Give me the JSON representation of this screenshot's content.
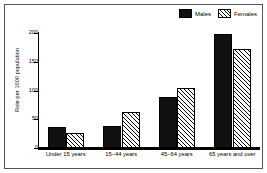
{
  "chart_data": {
    "type": "bar",
    "title": "",
    "xlabel": "",
    "ylabel": "Rate per 1000 population",
    "categories": [
      "Under 15 years",
      "15–44 years",
      "45–64 years",
      "65 years and over"
    ],
    "series": [
      {
        "name": "Males",
        "values": [
          36,
          39,
          88,
          198
        ]
      },
      {
        "name": "Females",
        "values": [
          26,
          63,
          104,
          172
        ]
      }
    ],
    "ylim": [
      0,
      200
    ],
    "yticks": [
      0,
      50,
      100,
      150,
      200
    ],
    "ytick_labels": [
      "0",
      "50",
      "100",
      "150",
      "200"
    ],
    "grid": false,
    "legend_position": "top-right"
  },
  "legend": {
    "males_label": "Males",
    "females_label": "Females"
  },
  "colors": {
    "males_fill": "#111111",
    "females_fill": "#ffffff",
    "hatch": "#000000",
    "axis": "#000000",
    "frame": "#555555",
    "background": "#ffffff"
  }
}
